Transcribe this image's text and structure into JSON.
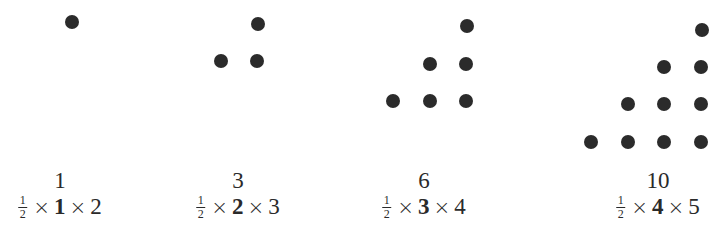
{
  "dot_color": "#2b2b2b",
  "groups": [
    {
      "number": "1",
      "formula": {
        "frac_num": "1",
        "frac_den": "2",
        "times": "×",
        "n": "1",
        "n_plus_1": "2"
      },
      "dots": [
        [
          72,
          22
        ]
      ]
    },
    {
      "number": "3",
      "formula": {
        "frac_num": "1",
        "frac_den": "2",
        "times": "×",
        "n": "2",
        "n_plus_1": "3"
      },
      "dots": [
        [
          258,
          24
        ],
        [
          221,
          61
        ],
        [
          257,
          61
        ]
      ]
    },
    {
      "number": "6",
      "formula": {
        "frac_num": "1",
        "frac_den": "2",
        "times": "×",
        "n": "3",
        "n_plus_1": "4"
      },
      "dots": [
        [
          467,
          26
        ],
        [
          430,
          64
        ],
        [
          466,
          64
        ],
        [
          393,
          101
        ],
        [
          430,
          101
        ],
        [
          466,
          101
        ]
      ]
    },
    {
      "number": "10",
      "formula": {
        "frac_num": "1",
        "frac_den": "2",
        "times": "×",
        "n": "4",
        "n_plus_1": "5"
      },
      "dots": [
        [
          702,
          30
        ],
        [
          664,
          67
        ],
        [
          701,
          67
        ],
        [
          628,
          104
        ],
        [
          664,
          104
        ],
        [
          701,
          104
        ],
        [
          591,
          142
        ],
        [
          628,
          142
        ],
        [
          664,
          142
        ],
        [
          701,
          142
        ]
      ]
    }
  ],
  "label_centers_x": [
    60,
    238,
    424,
    658
  ]
}
